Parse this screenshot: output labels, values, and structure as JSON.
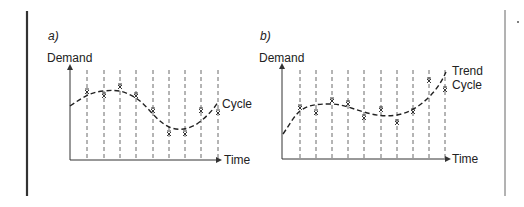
{
  "panels": [
    {
      "id": "a",
      "label": "a)",
      "ylabel": "Demand",
      "xlabel": "Time",
      "curve_label_1": "Cycle",
      "curve_label_2": ""
    },
    {
      "id": "b",
      "label": "b)",
      "ylabel": "Demand",
      "xlabel": "Time",
      "curve_label_1": "Trend",
      "curve_label_2": "Cycle"
    }
  ],
  "colors": {
    "ink": "#222222",
    "dash": "#333333",
    "border": "#444444",
    "bg": "#ffffff"
  }
}
